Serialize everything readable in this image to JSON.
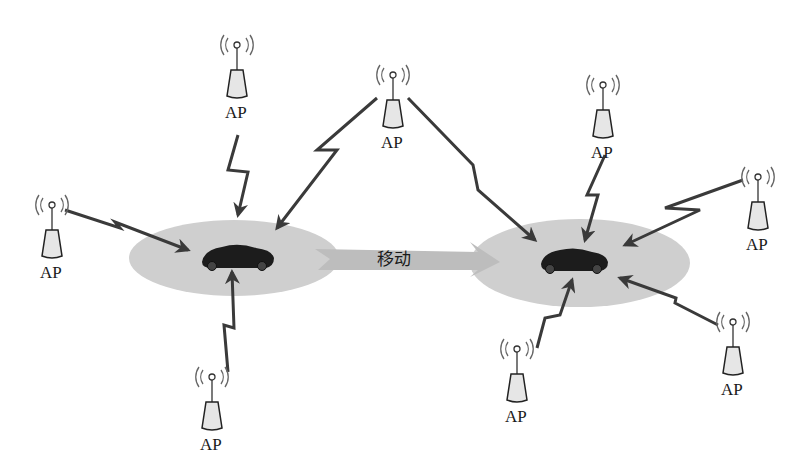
{
  "diagram": {
    "move_label": "移动",
    "ap_label": "AP",
    "colors": {
      "cell": "#cfcfcf",
      "arrow_fill": "#bdbdbd",
      "signal": "#3a3a3a",
      "car": "#1c1c1c",
      "ap_body": "#e6e6e6"
    },
    "access_points": [
      {
        "id": "ap-1",
        "label": "AP",
        "x": 237,
        "y": 48
      },
      {
        "id": "ap-2",
        "label": "AP",
        "x": 393,
        "y": 78
      },
      {
        "id": "ap-3",
        "label": "AP",
        "x": 52,
        "y": 208
      },
      {
        "id": "ap-4",
        "label": "AP",
        "x": 212,
        "y": 380
      },
      {
        "id": "ap-5",
        "label": "AP",
        "x": 603,
        "y": 88
      },
      {
        "id": "ap-6",
        "label": "AP",
        "x": 758,
        "y": 180
      },
      {
        "id": "ap-7",
        "label": "AP",
        "x": 517,
        "y": 352
      },
      {
        "id": "ap-8",
        "label": "AP",
        "x": 733,
        "y": 325
      }
    ],
    "cells": [
      {
        "id": "cell-left",
        "cx": 234,
        "cy": 258,
        "rx": 105,
        "ry": 38
      },
      {
        "id": "cell-right",
        "cx": 580,
        "cy": 263,
        "rx": 110,
        "ry": 44
      }
    ]
  }
}
